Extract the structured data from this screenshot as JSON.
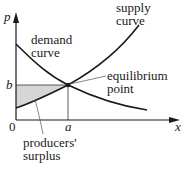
{
  "diagram": {
    "title": "",
    "axes": {
      "x_label": "x",
      "y_label": "p",
      "origin_label": "0",
      "x_tick_label": "a",
      "y_tick_label": "b"
    },
    "curves": {
      "demand": {
        "label_line1": "demand",
        "label_line2": "curve"
      },
      "supply": {
        "label_line1": "supply",
        "label_line2": "curve"
      }
    },
    "annotations": {
      "equilibrium": {
        "line1": "equilibrium",
        "line2": "point"
      },
      "surplus": {
        "line1": "producers'",
        "line2": "surplus"
      }
    },
    "colors": {
      "line": "#1a1a1a",
      "shade": "#d6d6d6",
      "leader": "#555555"
    }
  }
}
